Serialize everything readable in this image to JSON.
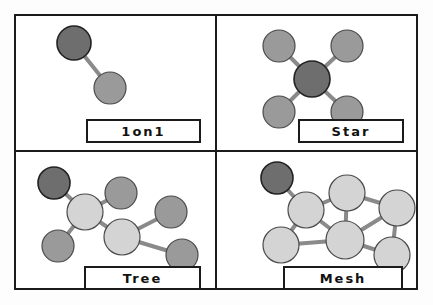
{
  "figure": {
    "type": "diagram",
    "layout": "2x2-grid",
    "background_color": "#fdfdfd",
    "frame_color": "#1b1b1b"
  },
  "palette": {
    "node_dark": "#6e6e6e",
    "node_medium": "#9a9a9a",
    "node_light": "#d4d4d4",
    "node_stroke": "#4a4a4a",
    "node_stroke_dark": "#222222",
    "edge": "#8a8a8a",
    "edge_stroke": "#6f6f6f",
    "caption_text": "#111111",
    "panel_background": "#ffffff"
  },
  "panels": [
    {
      "id": "oneonone",
      "label": "1on1",
      "position": "top-left",
      "caption_box": {
        "x": 86,
        "y": 119,
        "width": 115,
        "height": 24
      },
      "nodes": [
        {
          "id": "a",
          "cx": 74,
          "cy": 43,
          "r": 17,
          "shade": "dark"
        },
        {
          "id": "b",
          "cx": 110,
          "cy": 88,
          "r": 16,
          "shade": "medium"
        }
      ],
      "edges": [
        {
          "from": "a",
          "to": "b"
        }
      ]
    },
    {
      "id": "star",
      "label": "Star",
      "position": "top-right",
      "caption_box": {
        "x": 298,
        "y": 119,
        "width": 106,
        "height": 24
      },
      "nodes": [
        {
          "id": "center",
          "cx": 312,
          "cy": 79,
          "r": 18,
          "shade": "dark"
        },
        {
          "id": "nw",
          "cx": 279,
          "cy": 46,
          "r": 16,
          "shade": "medium"
        },
        {
          "id": "ne",
          "cx": 347,
          "cy": 46,
          "r": 16,
          "shade": "medium"
        },
        {
          "id": "sw",
          "cx": 279,
          "cy": 112,
          "r": 16,
          "shade": "medium"
        },
        {
          "id": "se",
          "cx": 347,
          "cy": 112,
          "r": 16,
          "shade": "medium"
        }
      ],
      "edges": [
        {
          "from": "center",
          "to": "nw"
        },
        {
          "from": "center",
          "to": "ne"
        },
        {
          "from": "center",
          "to": "sw"
        },
        {
          "from": "center",
          "to": "se"
        }
      ]
    },
    {
      "id": "tree",
      "label": "Tree",
      "position": "bottom-left",
      "caption_box": {
        "x": 84,
        "y": 266,
        "width": 117,
        "height": 24
      },
      "nodes": [
        {
          "id": "root",
          "cx": 54,
          "cy": 183,
          "r": 16,
          "shade": "dark"
        },
        {
          "id": "hub1",
          "cx": 85,
          "cy": 212,
          "r": 18,
          "shade": "light"
        },
        {
          "id": "leaf1",
          "cx": 121,
          "cy": 193,
          "r": 16,
          "shade": "medium"
        },
        {
          "id": "leaf2",
          "cx": 58,
          "cy": 246,
          "r": 16,
          "shade": "medium"
        },
        {
          "id": "hub2",
          "cx": 122,
          "cy": 237,
          "r": 18,
          "shade": "light"
        },
        {
          "id": "leaf3",
          "cx": 171,
          "cy": 212,
          "r": 16,
          "shade": "medium"
        },
        {
          "id": "leaf4",
          "cx": 182,
          "cy": 255,
          "r": 16,
          "shade": "medium"
        }
      ],
      "edges": [
        {
          "from": "root",
          "to": "hub1"
        },
        {
          "from": "hub1",
          "to": "leaf1"
        },
        {
          "from": "hub1",
          "to": "leaf2"
        },
        {
          "from": "hub1",
          "to": "hub2"
        },
        {
          "from": "hub2",
          "to": "leaf3"
        },
        {
          "from": "hub2",
          "to": "leaf4"
        }
      ]
    },
    {
      "id": "mesh",
      "label": "Mesh",
      "position": "bottom-right",
      "caption_box": {
        "x": 283,
        "y": 266,
        "width": 120,
        "height": 24
      },
      "nodes": [
        {
          "id": "m_dark",
          "cx": 277,
          "cy": 178,
          "r": 16,
          "shade": "dark"
        },
        {
          "id": "m_left",
          "cx": 306,
          "cy": 210,
          "r": 18,
          "shade": "light"
        },
        {
          "id": "m_top",
          "cx": 347,
          "cy": 193,
          "r": 18,
          "shade": "light"
        },
        {
          "id": "m_right",
          "cx": 397,
          "cy": 208,
          "r": 18,
          "shade": "light"
        },
        {
          "id": "m_bottomleft",
          "cx": 281,
          "cy": 245,
          "r": 18,
          "shade": "light"
        },
        {
          "id": "m_center",
          "cx": 345,
          "cy": 240,
          "r": 19,
          "shade": "light"
        },
        {
          "id": "m_bottomright",
          "cx": 392,
          "cy": 255,
          "r": 18,
          "shade": "light"
        }
      ],
      "edges": [
        {
          "from": "m_dark",
          "to": "m_left"
        },
        {
          "from": "m_left",
          "to": "m_top"
        },
        {
          "from": "m_left",
          "to": "m_bottomleft"
        },
        {
          "from": "m_left",
          "to": "m_center"
        },
        {
          "from": "m_top",
          "to": "m_right"
        },
        {
          "from": "m_top",
          "to": "m_center"
        },
        {
          "from": "m_right",
          "to": "m_center"
        },
        {
          "from": "m_right",
          "to": "m_bottomright"
        },
        {
          "from": "m_bottomleft",
          "to": "m_center"
        },
        {
          "from": "m_center",
          "to": "m_bottomright"
        }
      ]
    }
  ]
}
